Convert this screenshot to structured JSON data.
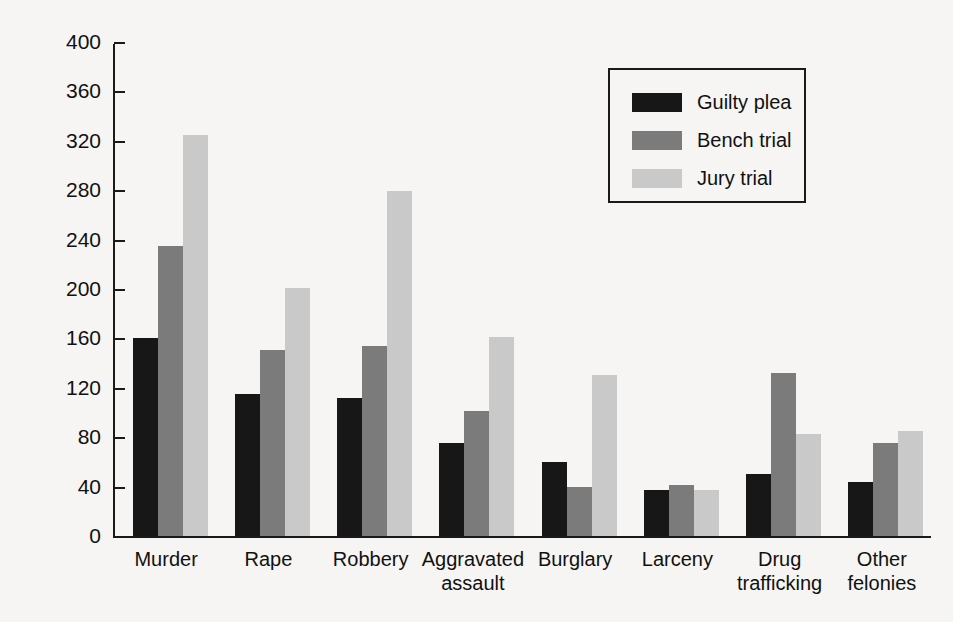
{
  "chart_data": {
    "type": "bar",
    "title": "",
    "xlabel": "",
    "ylabel": "Mean prison sentence (months)",
    "ylim": [
      0,
      400
    ],
    "ytick_step": 40,
    "yticks": [
      0,
      40,
      80,
      120,
      160,
      200,
      240,
      280,
      320,
      360,
      400
    ],
    "grid": false,
    "legend_position": "upper right",
    "categories": [
      "Murder",
      "Rape",
      "Robbery",
      "Aggravated\nassault",
      "Burglary",
      "Larceny",
      "Drug\ntrafficking",
      "Other\nfelonies"
    ],
    "series": [
      {
        "name": "Guilty plea",
        "color": "#171717",
        "values": [
          160,
          115,
          112,
          75,
          60,
          37,
          50,
          44
        ]
      },
      {
        "name": "Bench trial",
        "color": "#7b7b7b",
        "values": [
          235,
          151,
          154,
          101,
          40,
          41,
          132,
          75
        ]
      },
      {
        "name": "Jury trial",
        "color": "#c9c9c9",
        "values": [
          325,
          201,
          279,
          161,
          130,
          37,
          83,
          85
        ]
      }
    ]
  },
  "colors": {
    "background": "#f6f5f3",
    "axis": "#1a1a1a",
    "text": "#111111"
  }
}
